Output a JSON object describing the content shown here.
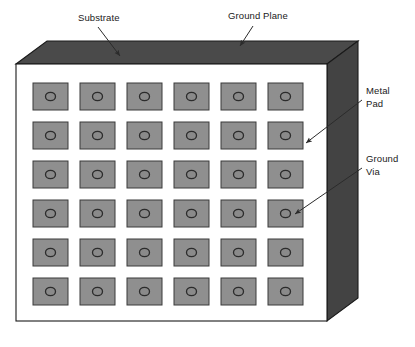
{
  "figure": {
    "type": "technical-illustration"
  },
  "board": {
    "name": "pcb-board",
    "faces": {
      "top_face_label": "Ground Plane",
      "front_face_label": "Substrate",
      "side_face_label": "Substrate edge"
    },
    "colors": {
      "top_face": "#4a4a4a",
      "side_face": "#434343",
      "front_face": "#ffffff",
      "outline": "#1a1a1a",
      "pad_fill": "#8f8f8f",
      "pad_outline": "#3a3a3a",
      "via_fill": "#8a8a8a",
      "via_outline": "#2b2b2b",
      "text": "#1a1a1a",
      "leader_line": "#2b2b2b"
    }
  },
  "grid": {
    "name": "metal-pad-grid",
    "rows": 6,
    "columns": 6,
    "pad_count": 36,
    "via_count": 36,
    "pad_width": 35,
    "pad_height": 27,
    "col_step": 47,
    "row_step": 39,
    "origin_x": 33,
    "origin_y": 83,
    "via_radius_x": 5,
    "via_radius_y": 4.2
  },
  "labels": [
    {
      "id": "substrate",
      "text": "Substrate",
      "lines": [
        "Substrate"
      ],
      "position": "top-left",
      "points_to": "front-face-top-edge"
    },
    {
      "id": "ground-plane",
      "text": "Ground Plane",
      "lines": [
        "Ground Plane"
      ],
      "position": "top-center",
      "points_to": "top-face"
    },
    {
      "id": "metal-pad",
      "text": "Metal Pad",
      "lines": [
        "Metal",
        "Pad"
      ],
      "position": "right-upper",
      "points_to": "pad-row2-col6"
    },
    {
      "id": "ground-via",
      "text": "Ground Via",
      "lines": [
        "Ground",
        "Via"
      ],
      "position": "right-lower",
      "points_to": "via-row4-col6"
    }
  ]
}
